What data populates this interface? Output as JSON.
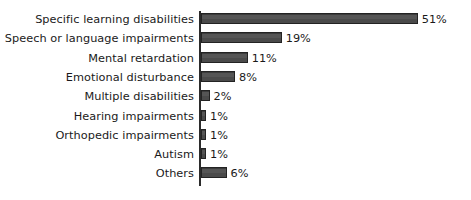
{
  "chart_data": {
    "type": "bar",
    "orientation": "horizontal",
    "title": "",
    "xlabel": "",
    "ylabel": "",
    "xlim": [
      0,
      51
    ],
    "grid": false,
    "legend": false,
    "value_suffix": "%",
    "categories": [
      "Specific learning disabilities",
      "Speech or language impairments",
      "Mental retardation",
      "Emotional disturbance",
      "Multiple disabilities",
      "Hearing impairments",
      "Orthopedic impairments",
      "Autism",
      "Others"
    ],
    "values": [
      51,
      19,
      11,
      8,
      2,
      1,
      1,
      1,
      6
    ],
    "value_labels": [
      "51%",
      "19%",
      "11%",
      "8%",
      "2%",
      "1%",
      "1%",
      "1%",
      "6%"
    ],
    "colors": {
      "bar_fill": "#4d4d4d",
      "bar_border": "#232323",
      "axis": "#2b2b2b",
      "text": "#1a1a1a",
      "background": "#ffffff"
    }
  }
}
